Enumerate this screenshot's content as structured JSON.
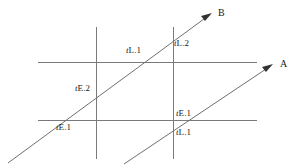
{
  "figure": {
    "background_color": "#ffffff",
    "line_color": "#7a7a7a",
    "ray_color": "#6f6f6f",
    "text_color": "#1a1a1a"
  },
  "rays": [
    {
      "name": "process-b-timeline",
      "label": "B",
      "label_x": 218,
      "label_y": 8,
      "x1": 8,
      "y1": 163,
      "x2": 211,
      "y2": 14
    },
    {
      "name": "process-a-timeline",
      "label": "A",
      "label_x": 280,
      "label_y": 59,
      "x1": 124,
      "y1": 164,
      "x2": 272,
      "y2": 65
    }
  ],
  "horizontal_lines": [
    {
      "name": "upper-horizontal-line",
      "x1": 38,
      "x2": 257,
      "y": 62
    },
    {
      "name": "lower-horizontal-line",
      "x1": 38,
      "x2": 257,
      "y": 120
    }
  ],
  "vertical_lines": [
    {
      "name": "left-vertical-line",
      "x": 96,
      "y1": 27,
      "y2": 159
    },
    {
      "name": "right-vertical-line",
      "x": 173,
      "y1": 27,
      "y2": 159
    }
  ],
  "labels": [
    {
      "name": "label-tl1-upper",
      "italic": "t",
      "rest": "L.1",
      "x": 126,
      "y": 46
    },
    {
      "name": "label-tl2",
      "italic": "t",
      "rest": "L.2",
      "x": 174,
      "y": 39
    },
    {
      "name": "label-te2",
      "italic": "t",
      "rest": "E.2",
      "x": 75,
      "y": 84
    },
    {
      "name": "label-te1-left",
      "italic": "t",
      "rest": "E.1",
      "x": 56,
      "y": 123
    },
    {
      "name": "label-te1-right",
      "italic": "t",
      "rest": "E.1",
      "x": 176,
      "y": 109
    },
    {
      "name": "label-tl1-lower",
      "italic": "t",
      "rest": "L.1",
      "x": 176,
      "y": 128
    }
  ]
}
